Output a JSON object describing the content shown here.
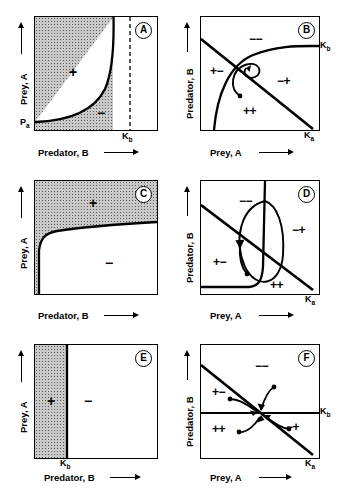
{
  "figure": {
    "panels": [
      {
        "id": "A",
        "letter": "A",
        "xlabel": "Predator, B",
        "ylabel": "Prey, A",
        "ticks": [
          {
            "name": "k-b",
            "text": "K",
            "sub": "b"
          },
          {
            "name": "p-a",
            "text": "P",
            "sub": "a"
          }
        ],
        "signs": [
          {
            "name": "plus-region",
            "text": "+"
          },
          {
            "name": "minus-region",
            "text": "−"
          }
        ],
        "type": "isocline-shaded-concave"
      },
      {
        "id": "B",
        "letter": "B",
        "xlabel": "Prey, A",
        "ylabel": "Predator, B",
        "ticks": [
          {
            "name": "k-b",
            "text": "K",
            "sub": "b"
          },
          {
            "name": "k-a",
            "text": "K",
            "sub": "a"
          }
        ],
        "signs": [
          {
            "name": "minus-minus-quadrant",
            "text": "−−"
          },
          {
            "name": "plus-minus-quadrant",
            "text": "+−"
          },
          {
            "name": "minus-plus-quadrant",
            "text": "−+"
          },
          {
            "name": "plus-plus-quadrant",
            "text": "++"
          }
        ],
        "type": "phase-plane-spiral-inward"
      },
      {
        "id": "C",
        "letter": "C",
        "xlabel": "Predator, B",
        "ylabel": "Prey, A",
        "ticks": [],
        "signs": [
          {
            "name": "plus-region",
            "text": "+"
          },
          {
            "name": "minus-region",
            "text": "−"
          }
        ],
        "type": "isocline-shaded-upper"
      },
      {
        "id": "D",
        "letter": "D",
        "xlabel": "Prey, A",
        "ylabel": "Predator, B",
        "ticks": [
          {
            "name": "k-a",
            "text": "K",
            "sub": "a"
          }
        ],
        "signs": [
          {
            "name": "minus-minus-quadrant",
            "text": "−−"
          },
          {
            "name": "plus-minus-quadrant",
            "text": "+−"
          },
          {
            "name": "minus-plus-quadrant",
            "text": "−+"
          },
          {
            "name": "plus-plus-quadrant",
            "text": "++"
          }
        ],
        "type": "phase-plane-limit-cycle"
      },
      {
        "id": "E",
        "letter": "E",
        "xlabel": "Predator, B",
        "ylabel": "Prey, A",
        "ticks": [
          {
            "name": "k-b",
            "text": "K",
            "sub": "b"
          }
        ],
        "signs": [
          {
            "name": "plus-region",
            "text": "+"
          },
          {
            "name": "minus-region",
            "text": "−"
          }
        ],
        "type": "isocline-vertical-band"
      },
      {
        "id": "F",
        "letter": "F",
        "xlabel": "Prey, A",
        "ylabel": "Predator, B",
        "ticks": [
          {
            "name": "k-b",
            "text": "K",
            "sub": "b"
          },
          {
            "name": "k-a",
            "text": "K",
            "sub": "a"
          }
        ],
        "signs": [
          {
            "name": "minus-minus-quadrant",
            "text": "−−"
          },
          {
            "name": "plus-minus-quadrant",
            "text": "+−"
          },
          {
            "name": "minus-plus-quadrant",
            "text": "−+"
          },
          {
            "name": "plus-plus-quadrant",
            "text": "++"
          }
        ],
        "type": "phase-plane-stable-node"
      }
    ]
  }
}
